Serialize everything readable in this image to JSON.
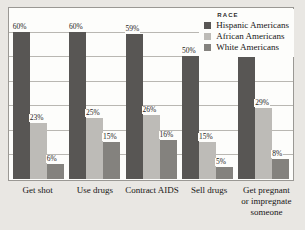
{
  "legend": {
    "title": "RACE",
    "entries": [
      {
        "label": "Hispanic Americans",
        "color": "#585654"
      },
      {
        "label": "African Americans",
        "color": "#bdbbb7"
      },
      {
        "label": "White Americans",
        "color": "#84827e"
      }
    ]
  },
  "chart_data": {
    "type": "bar",
    "title": "",
    "xlabel": "",
    "ylabel": "",
    "ylim": [
      0,
      70
    ],
    "grid": true,
    "legend_position": "top-right",
    "legend_title": "RACE",
    "value_suffix": "%",
    "categories": [
      "Get shot",
      "Use drugs",
      "Contract AIDS",
      "Sell drugs",
      "Get pregnant or impregnate someone"
    ],
    "category_lines": [
      [
        "Get shot"
      ],
      [
        "Use drugs"
      ],
      [
        "Contract AIDS"
      ],
      [
        "Sell drugs"
      ],
      [
        "Get pregnant",
        "or impregnate",
        "someone"
      ]
    ],
    "series": [
      {
        "name": "Hispanic Americans",
        "color": "#585654",
        "values": [
          60,
          60,
          59,
          50,
          50
        ],
        "labels": [
          "60%",
          "60%",
          "59%",
          "50%",
          "50%"
        ]
      },
      {
        "name": "African Americans",
        "color": "#bdbbb7",
        "values": [
          23,
          25,
          26,
          15,
          29
        ],
        "labels": [
          "23%",
          "25%",
          "26%",
          "15%",
          "29%"
        ]
      },
      {
        "name": "White Americans",
        "color": "#84827e",
        "values": [
          6,
          15,
          16,
          5,
          8
        ],
        "labels": [
          "6%",
          "15%",
          "16%",
          "5%",
          "8%"
        ]
      }
    ]
  }
}
